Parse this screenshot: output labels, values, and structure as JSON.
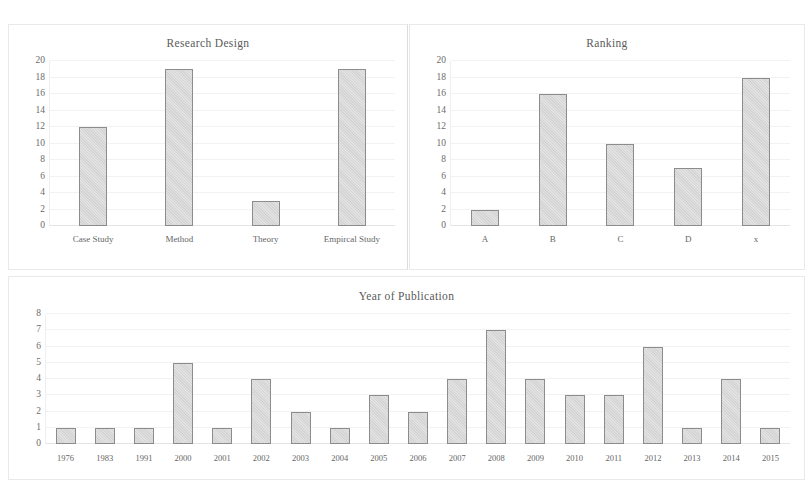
{
  "figure": {
    "background": "#ffffff",
    "bar_fill": "#dcdcdc",
    "bar_edge": "#8c8c8c",
    "grid_color": "#f2f2f2",
    "text_color": "#5a5a5a"
  },
  "chart_data": [
    {
      "id": "research_design",
      "type": "bar",
      "title": "Research Design",
      "xlabel": "",
      "ylabel": "",
      "categories": [
        "Case Study",
        "Method",
        "Theory",
        "Empircal Study"
      ],
      "values": [
        12,
        19,
        3,
        19
      ],
      "yticks": [
        0,
        2,
        4,
        6,
        8,
        10,
        12,
        14,
        16,
        18,
        20
      ],
      "ylim": [
        0,
        20
      ],
      "grid": true,
      "legend": null
    },
    {
      "id": "ranking",
      "type": "bar",
      "title": "Ranking",
      "xlabel": "",
      "ylabel": "",
      "categories": [
        "A",
        "B",
        "C",
        "D",
        "x"
      ],
      "values": [
        2,
        16,
        10,
        7,
        18
      ],
      "yticks": [
        0,
        2,
        4,
        6,
        8,
        10,
        12,
        14,
        16,
        18,
        20
      ],
      "ylim": [
        0,
        20
      ],
      "grid": true,
      "legend": null
    },
    {
      "id": "year_of_publication",
      "type": "bar",
      "title": "Year of Publication",
      "xlabel": "",
      "ylabel": "",
      "categories": [
        "1976",
        "1983",
        "1991",
        "2000",
        "2001",
        "2002",
        "2003",
        "2004",
        "2005",
        "2006",
        "2007",
        "2008",
        "2009",
        "2010",
        "2011",
        "2012",
        "2013",
        "2014",
        "2015"
      ],
      "values": [
        1,
        1,
        1,
        5,
        1,
        4,
        2,
        1,
        3,
        2,
        4,
        7,
        4,
        3,
        3,
        6,
        1,
        4,
        1
      ],
      "yticks": [
        0,
        1,
        2,
        3,
        4,
        5,
        6,
        7,
        8
      ],
      "ylim": [
        0,
        8
      ],
      "grid": true,
      "legend": null
    }
  ]
}
